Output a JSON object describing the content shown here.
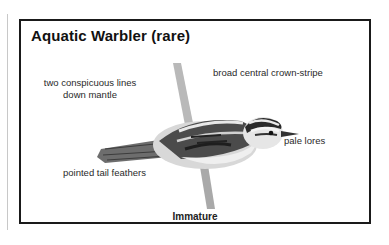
{
  "plate": {
    "title": "Aquatic Warbler (rare)",
    "caption": "Immature",
    "labels": {
      "mantle": "two conspicuous lines down mantle",
      "crown": "broad central crown-stripe",
      "lores": "pale lores",
      "tail": "pointed tail feathers"
    },
    "illustration": "aquatic-warbler-perched-on-reed"
  }
}
